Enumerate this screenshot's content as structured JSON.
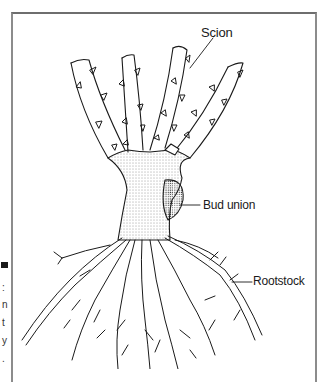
{
  "figure": {
    "caption_fragments": [
      ":",
      "n",
      "t",
      "y",
      "."
    ],
    "labels": {
      "scion": "Scion",
      "bud_union": "Bud union",
      "rootstock": "Rootstock"
    },
    "colors": {
      "ink": "#1a1a1a",
      "frame": "#8c8c8c",
      "background": "#ffffff"
    }
  }
}
